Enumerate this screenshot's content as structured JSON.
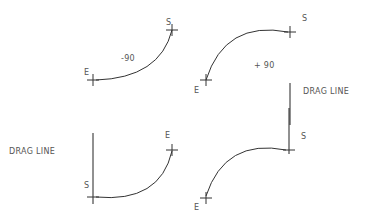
{
  "diagram": {
    "panels": [
      {
        "id": "top-left",
        "angle_label": "-90",
        "start_label": "S",
        "end_label": "E"
      },
      {
        "id": "top-right",
        "angle_label": "+ 90",
        "start_label": "S",
        "end_label": "E",
        "drag_label": "DRAG LINE"
      },
      {
        "id": "bottom-left",
        "start_label": "S",
        "end_label": "E",
        "drag_label": "DRAG LINE"
      },
      {
        "id": "bottom-right",
        "start_label": "S",
        "end_label": "E"
      }
    ],
    "colors": {
      "line": "#333333",
      "text": "#555555",
      "background": "#ffffff"
    }
  }
}
